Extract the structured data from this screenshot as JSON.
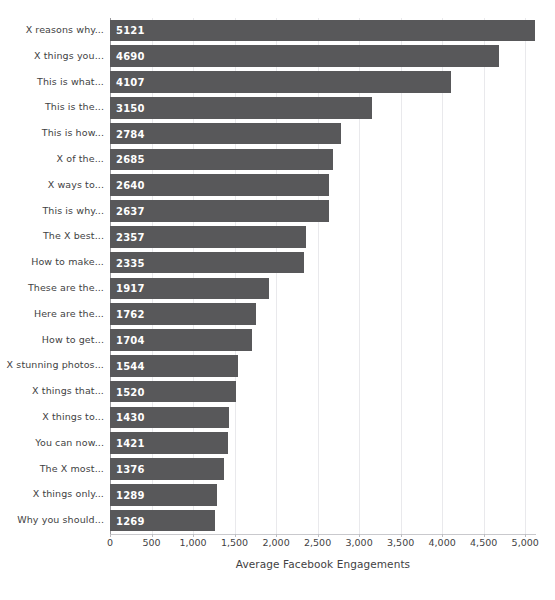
{
  "chart_data": {
    "type": "bar",
    "orientation": "horizontal",
    "title": "",
    "xlabel": "Average Facebook Engagements",
    "ylabel": "",
    "xlim": [
      0,
      5130
    ],
    "xticks": [
      0,
      500,
      1000,
      1500,
      2000,
      2500,
      3000,
      3500,
      4000,
      4500,
      5000
    ],
    "xticklabels": [
      "0",
      "500",
      "1,000",
      "1,500",
      "2,000",
      "2,500",
      "3,000",
      "3,500",
      "4,000",
      "4,500",
      "5,000"
    ],
    "grid": "vertical",
    "legend": "none",
    "bar_color": "#58585a",
    "value_label_color": "#ffffff",
    "categories": [
      "X reasons why...",
      "X things you...",
      "This is what...",
      "This is the...",
      "This is how...",
      "X of the...",
      "X ways to...",
      "This is why...",
      "The X best...",
      "How to make...",
      "These are the...",
      "Here are the...",
      "How to get...",
      "X stunning photos...",
      "X things that...",
      "X things to...",
      "You can now...",
      "The X most...",
      "X things only...",
      "Why you should..."
    ],
    "values": [
      5121,
      4690,
      4107,
      3150,
      2784,
      2685,
      2640,
      2637,
      2357,
      2335,
      1917,
      1762,
      1704,
      1544,
      1520,
      1430,
      1421,
      1376,
      1289,
      1269
    ],
    "value_labels": [
      "5121",
      "4690",
      "4107",
      "3150",
      "2784",
      "2685",
      "2640",
      "2637",
      "2357",
      "2335",
      "1917",
      "1762",
      "1704",
      "1544",
      "1520",
      "1430",
      "1421",
      "1376",
      "1289",
      "1269"
    ]
  },
  "footer": {
    "artifact_text": ""
  }
}
